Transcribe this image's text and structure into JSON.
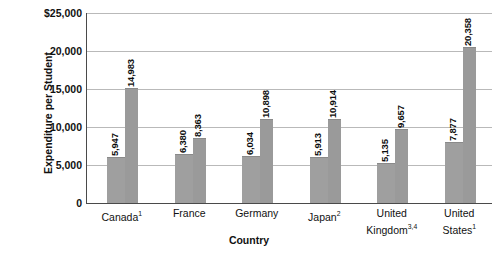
{
  "chart_data": {
    "type": "bar",
    "title": "",
    "xlabel": "Country",
    "ylabel": "Expenditure per Student",
    "categories": [
      "Canada",
      "France",
      "Germany",
      "Japan",
      "United Kingdom",
      "United States"
    ],
    "category_footnotes": [
      "1",
      "",
      "",
      "2",
      "3,4",
      "1"
    ],
    "category_labels_display": [
      [
        "Canada"
      ],
      [
        "France"
      ],
      [
        "Germany"
      ],
      [
        "Japan"
      ],
      [
        "United",
        "Kingdom"
      ],
      [
        "United",
        "States"
      ]
    ],
    "series": [
      {
        "name": "series-1",
        "values": [
          5947,
          6380,
          6034,
          5913,
          5135,
          7877
        ]
      },
      {
        "name": "series-2",
        "values": [
          14983,
          8363,
          10898,
          10914,
          9657,
          20358
        ]
      }
    ],
    "value_labels": [
      [
        "5,947",
        "14,983"
      ],
      [
        "6,380",
        "8,363"
      ],
      [
        "6,034",
        "10,898"
      ],
      [
        "5,913",
        "10,914"
      ],
      [
        "5,135",
        "9,657"
      ],
      [
        "7,877",
        "20,358"
      ]
    ],
    "ylim": [
      0,
      25000
    ],
    "yticks": [
      0,
      5000,
      10000,
      15000,
      20000,
      25000
    ],
    "ytick_labels": [
      "0",
      "5,000",
      "10,000",
      "15,000",
      "20,000",
      "$25,000"
    ],
    "grid": true,
    "legend": "none",
    "bar_color": "#9d9d9d",
    "grid_color": "#b9b9b9",
    "axis_color": "#4a4a4a"
  }
}
